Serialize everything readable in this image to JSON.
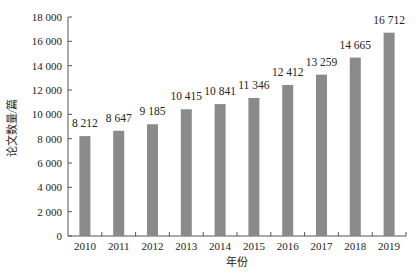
{
  "chart_data": {
    "type": "bar",
    "title": "",
    "xlabel": "年份",
    "ylabel": "论文数量/篇",
    "categories": [
      "2010",
      "2011",
      "2012",
      "2013",
      "2014",
      "2015",
      "2016",
      "2017",
      "2018",
      "2019"
    ],
    "values": [
      8212,
      8647,
      9185,
      10415,
      10841,
      11346,
      12412,
      13259,
      14665,
      16712
    ],
    "data_labels": [
      "8 212",
      "8 647",
      "9 185",
      "10 415",
      "10 841",
      "11 346",
      "12 412",
      "13 259",
      "14 665",
      "16 712"
    ],
    "ylim": [
      0,
      18000
    ],
    "yticks": [
      0,
      2000,
      4000,
      6000,
      8000,
      10000,
      12000,
      14000,
      16000,
      18000
    ],
    "ytick_labels": [
      "0",
      "2 000",
      "4 000",
      "6 000",
      "8 000",
      "10 000",
      "12 000",
      "14 000",
      "16 000",
      "18 000"
    ],
    "grid": false,
    "legend": null,
    "bar_color": "#8a8a8a"
  }
}
